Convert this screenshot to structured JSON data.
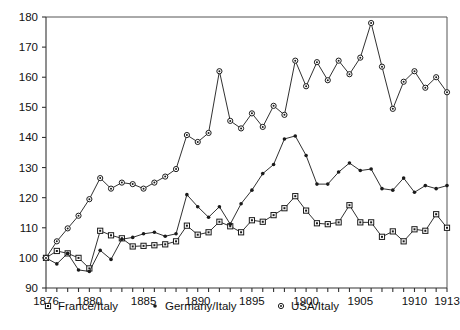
{
  "chart_data": {
    "type": "line",
    "title": "",
    "subtitle": "",
    "xlabel": "",
    "ylabel": "",
    "xlim": [
      1876,
      1913
    ],
    "ylim": [
      90,
      180
    ],
    "grid": false,
    "legend_position": "bottom",
    "y_ticks": [
      90,
      100,
      110,
      120,
      130,
      140,
      150,
      160,
      170,
      180
    ],
    "x_ticks": [
      1876,
      1877,
      1878,
      1879,
      1880,
      1881,
      1882,
      1883,
      1884,
      1885,
      1886,
      1887,
      1888,
      1889,
      1890,
      1891,
      1892,
      1893,
      1894,
      1895,
      1896,
      1897,
      1898,
      1899,
      1900,
      1901,
      1902,
      1903,
      1904,
      1905,
      1906,
      1907,
      1908,
      1909,
      1910,
      1911,
      1912,
      1913
    ],
    "x_tick_labels": [
      "1876",
      "1880",
      "1885",
      "1890",
      "1895",
      "1900",
      "1905",
      "1910",
      "1913"
    ],
    "x_tick_label_values": [
      1876,
      1880,
      1885,
      1890,
      1895,
      1900,
      1905,
      1910,
      1913
    ],
    "x": [
      1876,
      1877,
      1878,
      1879,
      1880,
      1881,
      1882,
      1883,
      1884,
      1885,
      1886,
      1887,
      1888,
      1889,
      1890,
      1891,
      1892,
      1893,
      1894,
      1895,
      1896,
      1897,
      1898,
      1899,
      1900,
      1901,
      1902,
      1903,
      1904,
      1905,
      1906,
      1907,
      1908,
      1909,
      1910,
      1911,
      1912,
      1913
    ],
    "series": [
      {
        "name": "France/Italy",
        "marker": "square",
        "color": "#1a1a1a",
        "values": [
          100.0,
          102.3,
          101.5,
          100.0,
          96.5,
          109.0,
          107.5,
          106.5,
          103.8,
          104.0,
          104.2,
          104.5,
          105.5,
          110.7,
          107.7,
          108.5,
          112.0,
          110.5,
          108.5,
          112.5,
          112.0,
          114.2,
          116.5,
          120.5,
          115.7,
          111.5,
          111.2,
          111.8,
          117.5,
          111.8,
          111.8,
          107.0,
          108.8,
          105.5,
          109.5,
          109.0,
          114.5,
          110.0
        ]
      },
      {
        "name": "Germany/Italy",
        "marker": "dot",
        "color": "#1a1a1a",
        "values": [
          100.0,
          98.0,
          101.5,
          96.0,
          95.5,
          102.5,
          99.5,
          106.2,
          106.8,
          108.0,
          108.5,
          107.2,
          108.0,
          121.0,
          117.0,
          113.5,
          117.0,
          111.2,
          118.0,
          122.5,
          128.0,
          131.0,
          139.5,
          140.5,
          134.0,
          124.5,
          124.5,
          128.5,
          131.5,
          129.0,
          129.5,
          123.0,
          122.5,
          126.5,
          121.8,
          124.0,
          123.0,
          124.0
        ]
      },
      {
        "name": "USA/Italy",
        "marker": "circle",
        "color": "#1a1a1a",
        "values": [
          100.0,
          105.5,
          109.8,
          114.0,
          119.5,
          126.5,
          123.0,
          125.0,
          124.5,
          123.0,
          125.0,
          127.0,
          129.5,
          140.8,
          138.5,
          141.5,
          162.0,
          145.5,
          143.0,
          148.0,
          143.5,
          150.5,
          147.5,
          165.5,
          157.0,
          165.0,
          159.0,
          165.5,
          161.0,
          166.5,
          178.0,
          163.5,
          149.5,
          158.5,
          162.0,
          156.5,
          160.0,
          155.0
        ]
      }
    ],
    "legend": [
      {
        "label": "France/Italy",
        "marker": "square"
      },
      {
        "label": "Germany/Italy",
        "marker": "dot"
      },
      {
        "label": "USA/Italy",
        "marker": "circle"
      }
    ]
  }
}
